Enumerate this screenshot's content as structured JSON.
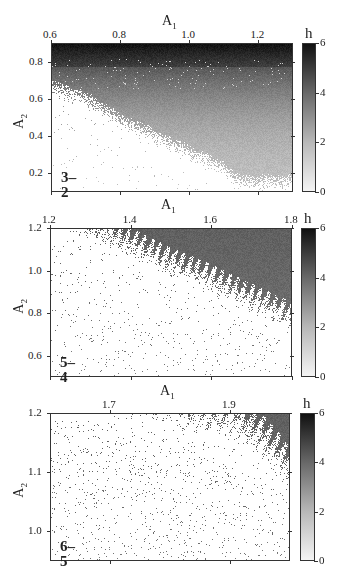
{
  "chart_data": [
    {
      "type": "heatmap",
      "panel_label": "3–2",
      "xlabel": "A",
      "xlabel_sub": "1",
      "ylabel": "A",
      "ylabel_sub": "2",
      "xlim": [
        0.6,
        1.3
      ],
      "ylim": [
        0.1,
        0.9
      ],
      "xticks": [
        0.6,
        0.8,
        1.0,
        1.2
      ],
      "xtick_labels": [
        "0.6",
        "0.8",
        "1.0",
        "1.2"
      ],
      "yticks": [
        0.2,
        0.4,
        0.6,
        0.8
      ],
      "ytick_labels": [
        "0.2",
        "0.4",
        "0.6",
        "0.8"
      ],
      "colorbar": {
        "label": "h",
        "range": [
          0,
          6
        ],
        "ticks": [
          0,
          2,
          4,
          6
        ],
        "tick_labels": [
          "0",
          "2",
          "4",
          "6"
        ]
      },
      "boundary": [
        [
          0.6,
          0.62
        ],
        [
          0.7,
          0.55
        ],
        [
          0.8,
          0.43
        ],
        [
          0.9,
          0.35
        ],
        [
          1.0,
          0.26
        ],
        [
          1.1,
          0.17
        ],
        [
          1.15,
          0.1
        ]
      ],
      "h_top": 5.2,
      "h_bottom": 1.4,
      "grid": false
    },
    {
      "type": "heatmap",
      "panel_label": "5–4",
      "xlabel": "A",
      "xlabel_sub": "1",
      "ylabel": "A",
      "ylabel_sub": "2",
      "xlim": [
        1.2,
        1.8
      ],
      "ylim": [
        0.5,
        1.2
      ],
      "xticks": [
        1.2,
        1.4,
        1.6,
        1.8
      ],
      "xtick_labels": [
        "1.2",
        "1.4",
        "1.6",
        "1.8"
      ],
      "yticks": [
        0.6,
        0.8,
        1.0,
        1.2
      ],
      "ytick_labels": [
        "0.6",
        "0.8",
        "1.0",
        "1.2"
      ],
      "colorbar": {
        "label": "h",
        "range": [
          0,
          6
        ],
        "ticks": [
          0,
          2,
          4,
          6
        ],
        "tick_labels": [
          "0",
          "2",
          "4",
          "6"
        ]
      },
      "boundary": [
        [
          1.2,
          1.2
        ],
        [
          1.3,
          1.14
        ],
        [
          1.4,
          1.05
        ],
        [
          1.5,
          0.96
        ],
        [
          1.6,
          0.88
        ],
        [
          1.7,
          0.79
        ],
        [
          1.8,
          0.7
        ]
      ],
      "h_top": 3.8,
      "h_bottom": 3.2,
      "grid": false
    },
    {
      "type": "heatmap",
      "panel_label": "6–5",
      "xlabel": "A",
      "xlabel_sub": "1",
      "ylabel": "A",
      "ylabel_sub": "2",
      "xlim": [
        1.6,
        2.0
      ],
      "ylim": [
        0.95,
        1.2
      ],
      "xticks": [
        1.7,
        1.9
      ],
      "xtick_labels": [
        "1.7",
        "1.9"
      ],
      "yticks": [
        1.0,
        1.1,
        1.2
      ],
      "ytick_labels": [
        "1.0",
        "1.1",
        "1.2"
      ],
      "colorbar": {
        "label": "h",
        "range": [
          0,
          6
        ],
        "ticks": [
          0,
          2,
          4,
          6
        ],
        "tick_labels": [
          "0",
          "2",
          "4",
          "6"
        ]
      },
      "boundary": [
        [
          1.6,
          1.2
        ],
        [
          1.7,
          1.19
        ],
        [
          1.8,
          1.17
        ],
        [
          1.9,
          1.15
        ],
        [
          1.95,
          1.12
        ],
        [
          2.0,
          1.06
        ]
      ],
      "h_top": 3.8,
      "h_bottom": 3.3,
      "grid": false
    }
  ]
}
